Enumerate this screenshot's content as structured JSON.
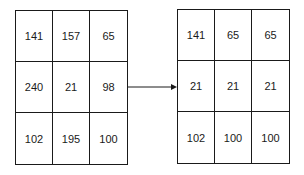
{
  "input_grid": {
    "rows": [
      [
        "141",
        "157",
        "65"
      ],
      [
        "240",
        "21",
        "98"
      ],
      [
        "102",
        "195",
        "100"
      ]
    ]
  },
  "output_grid": {
    "rows": [
      [
        "141",
        "65",
        "65"
      ],
      [
        "21",
        "21",
        "21"
      ],
      [
        "102",
        "100",
        "100"
      ]
    ]
  },
  "arrow": {
    "direction": "right",
    "icon": "arrow-right-icon"
  }
}
